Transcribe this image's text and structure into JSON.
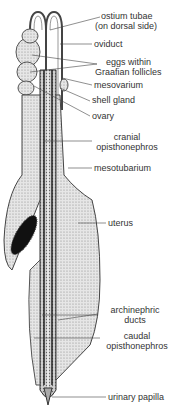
{
  "diagram": {
    "labels": {
      "ostium_1": "ostium tubae",
      "ostium_2": "(on dorsal side)",
      "oviduct": "oviduct",
      "eggs_1": "eggs within",
      "eggs_2": "Graafian follicles",
      "mesovarium": "mesovarium",
      "shell_gland": "shell gland",
      "ovary": "ovary",
      "cranial_1": "cranial",
      "cranial_2": "opisthonephros",
      "mesotubarium": "mesotubarium",
      "uterus": "uterus",
      "archi_1": "archinephric",
      "archi_2": "ducts",
      "caudal_1": "caudal",
      "caudal_2": "opisthonephros",
      "urinary_papilla": "urinary papilla"
    }
  }
}
